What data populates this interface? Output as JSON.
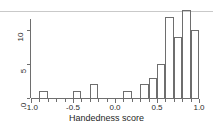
{
  "chart_data": {
    "type": "bar",
    "title": "",
    "subtitle": "",
    "xlabel": "Handedness score",
    "ylabel": "",
    "xlim": [
      -1.0,
      1.0
    ],
    "ylim": [
      0,
      13
    ],
    "grid": false,
    "legend": null,
    "bin_width": 0.1,
    "x_tick_labels": [
      "-1.0",
      "-0.5",
      "0.0",
      "0.5",
      "1.0"
    ],
    "x_tick_values": [
      -1.0,
      -0.5,
      0.0,
      0.5,
      1.0
    ],
    "y_tick_labels": [
      "0",
      "5",
      "10"
    ],
    "y_tick_values": [
      0,
      5,
      10
    ],
    "categories": [
      "-1.0 to -0.9",
      "-0.9 to -0.8",
      "-0.8 to -0.7",
      "-0.7 to -0.6",
      "-0.6 to -0.5",
      "-0.5 to -0.4",
      "-0.4 to -0.3",
      "-0.3 to -0.2",
      "-0.2 to -0.1",
      "-0.1 to 0.0",
      "0.0 to 0.1",
      "0.1 to 0.2",
      "0.2 to 0.3",
      "0.3 to 0.4",
      "0.4 to 0.5",
      "0.5 to 0.6",
      "0.6 to 0.7",
      "0.7 to 0.8",
      "0.8 to 0.9",
      "0.9 to 1.0"
    ],
    "bin_starts": [
      -1.0,
      -0.9,
      -0.8,
      -0.7,
      -0.6,
      -0.5,
      -0.4,
      -0.3,
      -0.2,
      -0.1,
      0.0,
      0.1,
      0.2,
      0.3,
      0.4,
      0.5,
      0.6,
      0.7,
      0.8,
      0.9
    ],
    "values": [
      0,
      1,
      0,
      0,
      0,
      1,
      0,
      2,
      0,
      0,
      0,
      1,
      0,
      2,
      3,
      5,
      12,
      9,
      13,
      10
    ],
    "colors": {
      "bar_edge": "#6e6e6e",
      "bar_fill": "transparent",
      "axis": "#6e6e6e",
      "text": "#1f1f1f"
    }
  },
  "figure": {
    "x_axis_title": "Handedness score"
  }
}
